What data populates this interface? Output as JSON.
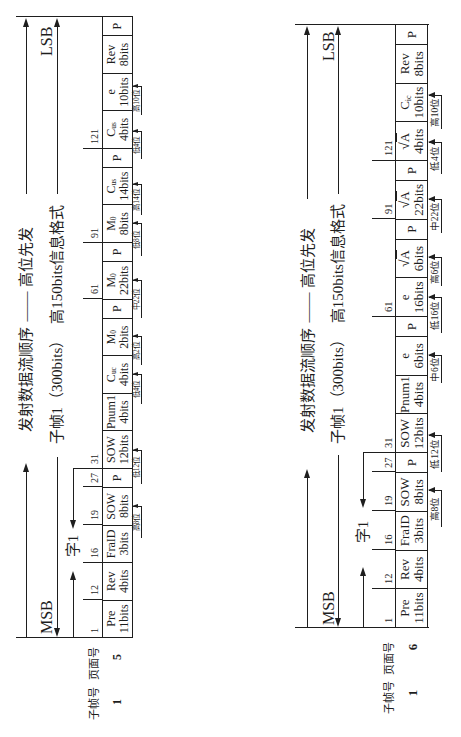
{
  "colors": {
    "ink": "#1e1e1e",
    "background": "#ffffff"
  },
  "left": {
    "title_line": {
      "part1": "发射数据流顺序",
      "dash": "——",
      "part2": "高位先发"
    },
    "span_line": {
      "part1": "子帧1（300bits）",
      "part2": "高150bits信息格式"
    },
    "msb": "MSB",
    "lsb": "LSB",
    "word_label": "字1",
    "header": {
      "subframe_no": "子帧号",
      "page_no": "页面号"
    },
    "values": {
      "subframe_no": "1",
      "page_no": "5"
    },
    "bit_positions": [
      "1",
      "12",
      "16",
      "19",
      "27",
      "31",
      "61",
      "91",
      "121"
    ],
    "cells": [
      {
        "name": "Pre",
        "bits": "11bits"
      },
      {
        "name": "Rev",
        "bits": "4bits"
      },
      {
        "name": "FraID",
        "bits": "3bits"
      },
      {
        "name": "SOW",
        "bits": "8bits"
      },
      {
        "name": "P"
      },
      {
        "name": "SOW",
        "bits": "12bits"
      },
      {
        "name": "Pnum1",
        "bits": "4bits"
      },
      {
        "name": "C",
        "sub": "uc",
        "bits": "4bits"
      },
      {
        "name": "M",
        "sub": "0",
        "bits": "2bits"
      },
      {
        "name": "P"
      },
      {
        "name": "M",
        "sub": "0",
        "bits": "22bits"
      },
      {
        "name": "P"
      },
      {
        "name": "M",
        "sub": "0",
        "bits": "8bits"
      },
      {
        "name": "C",
        "sub": "us",
        "bits": "14bits"
      },
      {
        "name": "P"
      },
      {
        "name": "C",
        "sub": "us",
        "bits": "4bits"
      },
      {
        "name": "e",
        "bits": "10bits"
      },
      {
        "name": "Rev",
        "bits": "8bits"
      },
      {
        "name": "P"
      }
    ],
    "annotations": [
      "高8位",
      "低12位",
      "低4位",
      "高2位",
      "中22位",
      "低8位",
      "高14位",
      "低4位",
      "高10位"
    ]
  },
  "right": {
    "title_line": {
      "part1": "发射数据流顺序",
      "dash": "——",
      "part2": "高位先发"
    },
    "span_line": {
      "part1": "子帧1（300bits）",
      "part2": "高150bits信息格式"
    },
    "msb": "MSB",
    "lsb": "LSB",
    "word_label": "字1",
    "header": {
      "subframe_no": "子帧号",
      "page_no": "页面号"
    },
    "values": {
      "subframe_no": "1",
      "page_no": "6"
    },
    "bit_positions": [
      "1",
      "12",
      "16",
      "19",
      "27",
      "31",
      "61",
      "91",
      "121"
    ],
    "cells": [
      {
        "name": "Pre",
        "bits": "11bits"
      },
      {
        "name": "Rev",
        "bits": "4bits"
      },
      {
        "name": "FraID",
        "bits": "3bits"
      },
      {
        "name": "SOW",
        "bits": "8bits"
      },
      {
        "name": "P"
      },
      {
        "name": "SOW",
        "bits": "12bits"
      },
      {
        "name": "Pnum1",
        "bits": "4bits"
      },
      {
        "name": "e",
        "bits": "6bits"
      },
      {
        "name": "P"
      },
      {
        "name": "e",
        "bits": "16bits"
      },
      {
        "radical": "√",
        "radicand": "A",
        "bits": "6bits"
      },
      {
        "name": "P"
      },
      {
        "radical": "√",
        "radicand": "A",
        "bits": "22bits"
      },
      {
        "name": "P"
      },
      {
        "radical": "√",
        "radicand": "A",
        "bits": "4bits"
      },
      {
        "name": "C",
        "sub": "ic",
        "bits": "10bits"
      },
      {
        "name": "Rev",
        "bits": "8bits"
      },
      {
        "name": "P"
      }
    ],
    "annotations": [
      "高8位",
      "低12位",
      "中6位",
      "低16位",
      "高6位",
      "中22位",
      "低4位",
      "高10位"
    ]
  }
}
